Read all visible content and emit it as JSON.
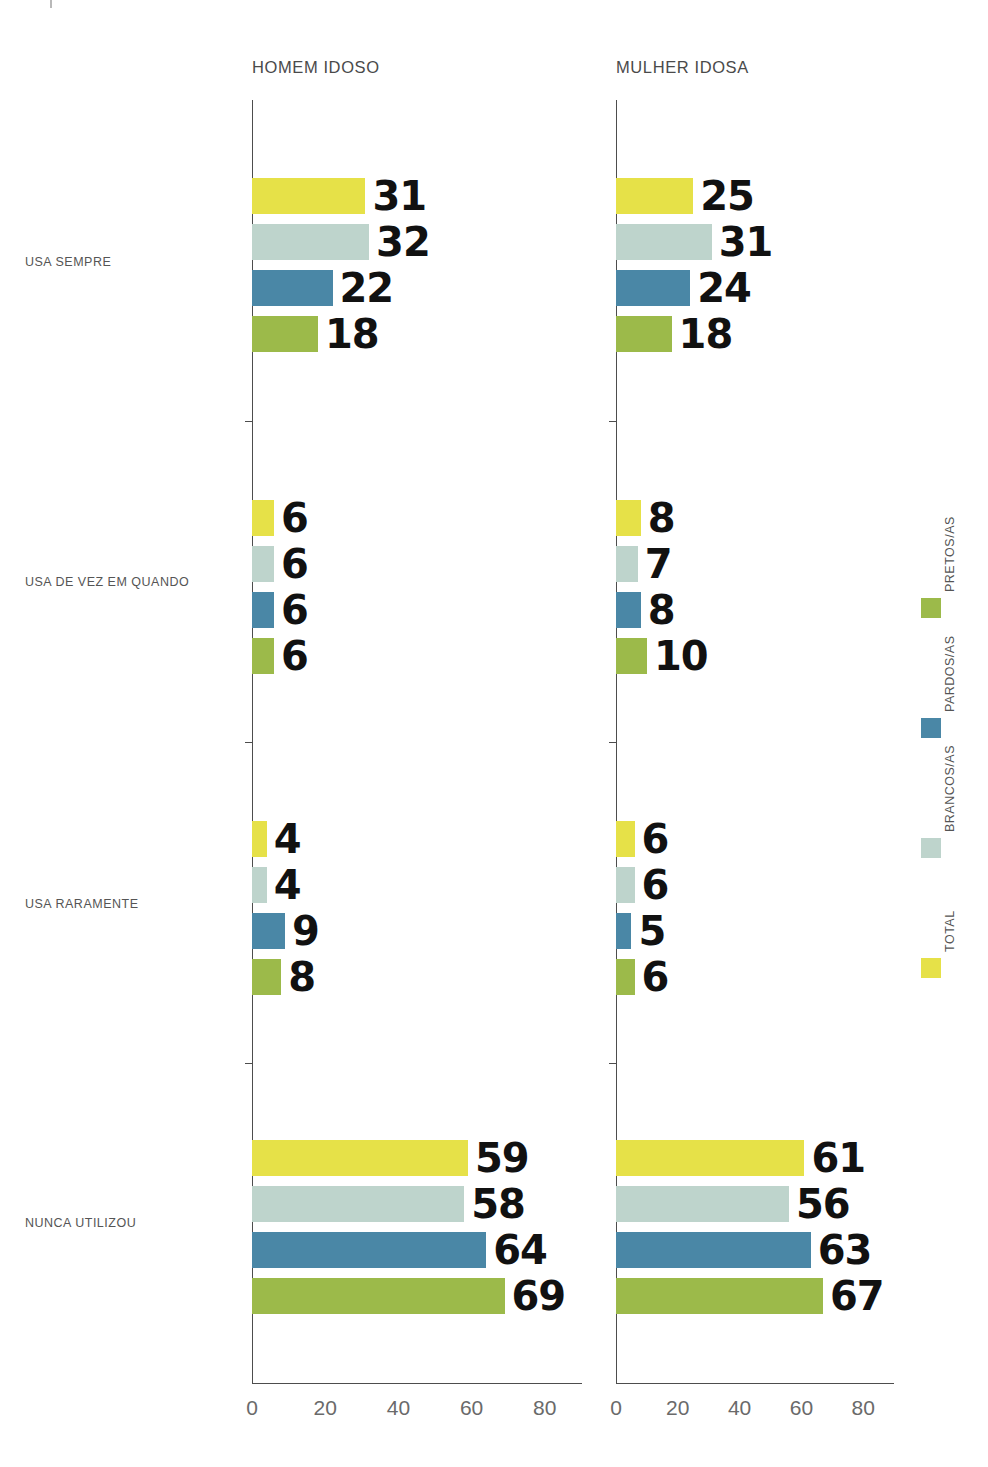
{
  "chart_data": {
    "type": "bar",
    "orientation": "horizontal",
    "title": "",
    "xlabel": "",
    "ylabel": "",
    "xlim": [
      0,
      90
    ],
    "xticks": [
      0,
      20,
      40,
      60,
      80
    ],
    "grid": false,
    "legend_position": "right-rotated",
    "categories": [
      "USA SEMPRE",
      "USA DE VEZ EM QUANDO",
      "USA RARAMENTE",
      "NUNCA UTILIZOU"
    ],
    "series": [
      {
        "name": "TOTAL",
        "color": "#e6e148"
      },
      {
        "name": "BRANCOS/AS",
        "color": "#bed4cc"
      },
      {
        "name": "PARDOS/AS",
        "color": "#4a87a6"
      },
      {
        "name": "PRETOS/AS",
        "color": "#9cba4a"
      }
    ],
    "panels": [
      {
        "title": "HOMEM IDOSO",
        "values": {
          "TOTAL": [
            31,
            6,
            4,
            59
          ],
          "BRANCOS/AS": [
            32,
            6,
            4,
            58
          ],
          "PARDOS/AS": [
            22,
            6,
            9,
            64
          ],
          "PRETOS/AS": [
            18,
            6,
            8,
            69
          ]
        }
      },
      {
        "title": "MULHER IDOSA",
        "values": {
          "TOTAL": [
            25,
            8,
            6,
            61
          ],
          "BRANCOS/AS": [
            31,
            7,
            6,
            56
          ],
          "PARDOS/AS": [
            24,
            8,
            5,
            63
          ],
          "PRETOS/AS": [
            18,
            10,
            6,
            67
          ]
        }
      }
    ]
  },
  "panels": {
    "men": {
      "title": "HOMEM IDOSO"
    },
    "women": {
      "title": "MULHER IDOSA"
    }
  },
  "axis": {
    "ticks": [
      {
        "label": "0"
      },
      {
        "label": "20"
      },
      {
        "label": "40"
      },
      {
        "label": "60"
      },
      {
        "label": "80"
      }
    ]
  },
  "categories": [
    {
      "label": "USA SEMPRE"
    },
    {
      "label": "USA DE VEZ EM QUANDO"
    },
    {
      "label": "USA RARAMENTE"
    },
    {
      "label": "NUNCA UTILIZOU"
    }
  ],
  "legend": {
    "items": [
      {
        "label": "PRETOS/AS",
        "color": "#9cba4a"
      },
      {
        "label": "PARDOS/AS",
        "color": "#4a87a6"
      },
      {
        "label": "BRANCOS/AS",
        "color": "#bed4cc"
      },
      {
        "label": "TOTAL",
        "color": "#e6e148"
      }
    ]
  }
}
